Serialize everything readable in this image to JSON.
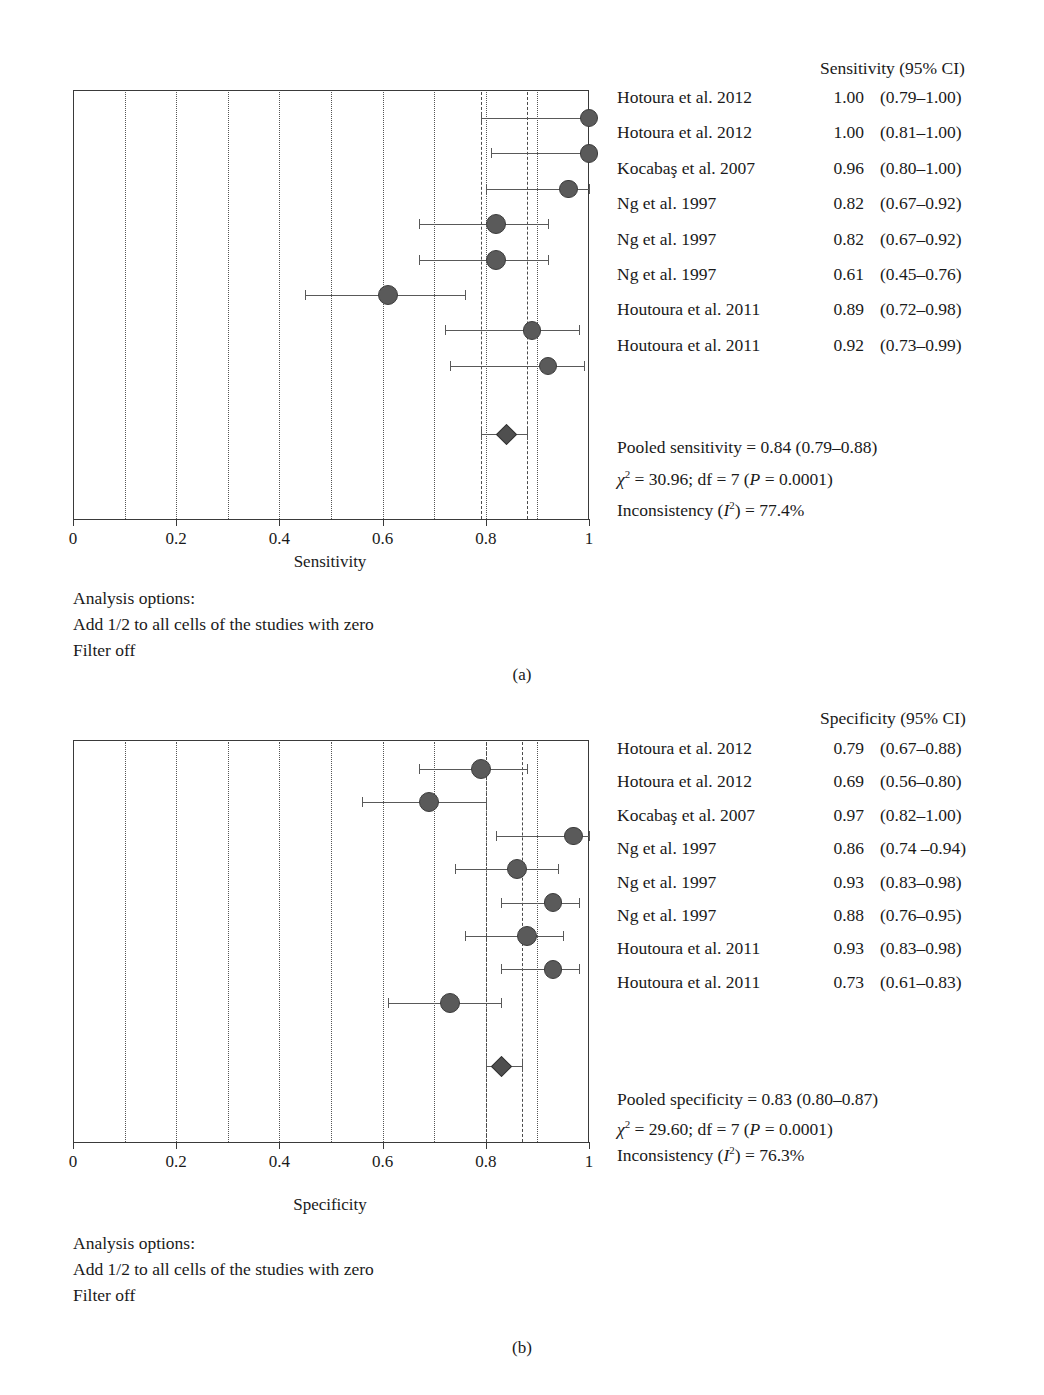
{
  "figure": {
    "panel_captions": [
      "(a)",
      "(b)"
    ],
    "bottom_caption": ""
  },
  "panel_a": {
    "column_header": "Sensitivity (95% CI)",
    "axis_title": "Sensitivity",
    "tick_labels": [
      "0",
      "0.2",
      "0.4",
      "0.6",
      "0.8",
      "1"
    ],
    "rows": [
      {
        "study": "Hotoura et al. 2012",
        "estimate": "1.00",
        "ci": "(0.79–1.00)"
      },
      {
        "study": "Hotoura et al. 2012",
        "estimate": "1.00",
        "ci": "(0.81–1.00)"
      },
      {
        "study": "Kocabaş et al. 2007",
        "estimate": "0.96",
        "ci": "(0.80–1.00)"
      },
      {
        "study": "Ng et al. 1997",
        "estimate": "0.82",
        "ci": "(0.67–0.92)"
      },
      {
        "study": "Ng et al. 1997",
        "estimate": "0.82",
        "ci": "(0.67–0.92)"
      },
      {
        "study": "Ng et al. 1997",
        "estimate": "0.61",
        "ci": "(0.45–0.76)"
      },
      {
        "study": "Houtoura et al. 2011",
        "estimate": "0.89",
        "ci": "(0.72–0.98)"
      },
      {
        "study": "Houtoura et al. 2011",
        "estimate": "0.92",
        "ci": "(0.73–0.99)"
      }
    ],
    "pooled_line": "Pooled sensitivity = 0.84 (0.79–0.88)",
    "chi_line_pre": "= 30.96; df = 7 (",
    "chi_line_p": "P",
    "chi_line_post": " = 0.0001)",
    "chi_symbol": "χ",
    "incons_pre": "Inconsistency (",
    "incons_i": "I",
    "incons_post": ") = 77.4%",
    "analysis_options": [
      "Analysis options:",
      "Add 1/2 to all cells of the studies with zero",
      "Filter off"
    ]
  },
  "panel_b": {
    "column_header": "Specificity (95% CI)",
    "axis_title": "Specificity",
    "tick_labels": [
      "0",
      "0.2",
      "0.4",
      "0.6",
      "0.8",
      "1"
    ],
    "rows": [
      {
        "study": "Hotoura et al. 2012",
        "estimate": "0.79",
        "ci": "(0.67–0.88)"
      },
      {
        "study": "Hotoura et al. 2012",
        "estimate": "0.69",
        "ci": "(0.56–0.80)"
      },
      {
        "study": "Kocabaş et al. 2007",
        "estimate": "0.97",
        "ci": "(0.82–1.00)"
      },
      {
        "study": "Ng et al. 1997",
        "estimate": "0.86",
        "ci": "(0.74 –0.94)"
      },
      {
        "study": "Ng et al. 1997",
        "estimate": "0.93",
        "ci": "(0.83–0.98)"
      },
      {
        "study": "Ng et al. 1997",
        "estimate": "0.88",
        "ci": "(0.76–0.95)"
      },
      {
        "study": "Houtoura et al. 2011",
        "estimate": "0.93",
        "ci": "(0.83–0.98)"
      },
      {
        "study": "Houtoura et al. 2011",
        "estimate": "0.73",
        "ci": "(0.61–0.83)"
      }
    ],
    "pooled_line": "Pooled specificity = 0.83 (0.80–0.87)",
    "chi_line_pre": "= 29.60; df = 7 (",
    "chi_line_p": "P",
    "chi_line_post": " = 0.0001)",
    "chi_symbol": "χ",
    "incons_pre": "Inconsistency (",
    "incons_i": "I",
    "incons_post": ") = 76.3%",
    "analysis_options": [
      "Analysis options:",
      "Add 1/2 to all cells of the studies with zero",
      "Filter off"
    ]
  },
  "chart_data": [
    {
      "type": "scatter",
      "subtype": "forest-plot",
      "panel": "(a)",
      "title": "Sensitivity (95% CI)",
      "xlabel": "Sensitivity",
      "ylabel": "",
      "xlim": [
        0,
        1
      ],
      "xticks": [
        0,
        0.2,
        0.4,
        0.6,
        0.8,
        1
      ],
      "xtick_labels": [
        "0",
        "0.2",
        "0.4",
        "0.6",
        "0.8",
        "1"
      ],
      "gridlines_every": 0.1,
      "grid": true,
      "legend": "none",
      "studies": [
        {
          "label": "Hotoura et al. 2012",
          "value": 1.0,
          "ci_low": 0.79,
          "ci_high": 1.0,
          "weight": 3
        },
        {
          "label": "Hotoura et al. 2012",
          "value": 1.0,
          "ci_low": 0.81,
          "ci_high": 1.0,
          "weight": 3
        },
        {
          "label": "Kocabaş et al. 2007",
          "value": 0.96,
          "ci_low": 0.8,
          "ci_high": 1.0,
          "weight": 3
        },
        {
          "label": "Ng et al. 1997",
          "value": 0.82,
          "ci_low": 0.67,
          "ci_high": 0.92,
          "weight": 4
        },
        {
          "label": "Ng et al. 1997",
          "value": 0.82,
          "ci_low": 0.67,
          "ci_high": 0.92,
          "weight": 4
        },
        {
          "label": "Ng et al. 1997",
          "value": 0.61,
          "ci_low": 0.45,
          "ci_high": 0.76,
          "weight": 4
        },
        {
          "label": "Houtoura et al. 2011",
          "value": 0.89,
          "ci_low": 0.72,
          "ci_high": 0.98,
          "weight": 3
        },
        {
          "label": "Houtoura et al. 2011",
          "value": 0.92,
          "ci_low": 0.73,
          "ci_high": 0.99,
          "weight": 3
        }
      ],
      "pooled": {
        "value": 0.84,
        "ci_low": 0.79,
        "ci_high": 0.88,
        "label": "Pooled sensitivity = 0.84 (0.79–0.88)"
      },
      "heterogeneity": {
        "chi2": 30.96,
        "df": 7,
        "p": 0.0001,
        "i2_percent": 77.4
      }
    },
    {
      "type": "scatter",
      "subtype": "forest-plot",
      "panel": "(b)",
      "title": "Specificity (95% CI)",
      "xlabel": "Specificity",
      "ylabel": "",
      "xlim": [
        0,
        1
      ],
      "xticks": [
        0,
        0.2,
        0.4,
        0.6,
        0.8,
        1
      ],
      "xtick_labels": [
        "0",
        "0.2",
        "0.4",
        "0.6",
        "0.8",
        "1"
      ],
      "gridlines_every": 0.1,
      "grid": true,
      "legend": "none",
      "studies": [
        {
          "label": "Hotoura et al. 2012",
          "value": 0.79,
          "ci_low": 0.67,
          "ci_high": 0.88,
          "weight": 4
        },
        {
          "label": "Hotoura et al. 2012",
          "value": 0.69,
          "ci_low": 0.56,
          "ci_high": 0.8,
          "weight": 4
        },
        {
          "label": "Kocabaş et al. 2007",
          "value": 0.97,
          "ci_low": 0.82,
          "ci_high": 1.0,
          "weight": 3
        },
        {
          "label": "Ng et al. 1997",
          "value": 0.86,
          "ci_low": 0.74,
          "ci_high": 0.94,
          "weight": 4
        },
        {
          "label": "Ng et al. 1997",
          "value": 0.93,
          "ci_low": 0.83,
          "ci_high": 0.98,
          "weight": 3
        },
        {
          "label": "Ng et al. 1997",
          "value": 0.88,
          "ci_low": 0.76,
          "ci_high": 0.95,
          "weight": 4
        },
        {
          "label": "Houtoura et al. 2011",
          "value": 0.93,
          "ci_low": 0.83,
          "ci_high": 0.98,
          "weight": 3
        },
        {
          "label": "Houtoura et al. 2011",
          "value": 0.73,
          "ci_low": 0.61,
          "ci_high": 0.83,
          "weight": 4
        }
      ],
      "pooled": {
        "value": 0.83,
        "ci_low": 0.8,
        "ci_high": 0.87,
        "label": "Pooled specificity = 0.83 (0.80–0.87)"
      },
      "heterogeneity": {
        "chi2": 29.6,
        "df": 7,
        "p": 0.0001,
        "i2_percent": 76.3
      }
    }
  ]
}
